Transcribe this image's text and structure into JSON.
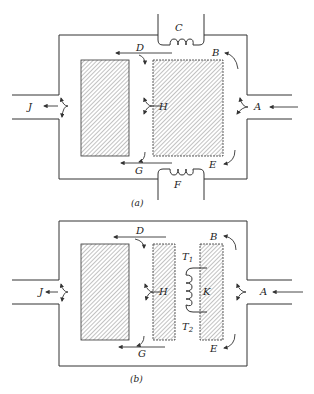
{
  "figure_a": {
    "caption": "(a)",
    "labels": {
      "A": "A",
      "B": "B",
      "C": "C",
      "D": "D",
      "E": "E",
      "F": "F",
      "G": "G",
      "H": "H",
      "J": "J"
    }
  },
  "figure_b": {
    "caption": "(b)",
    "labels": {
      "A": "A",
      "B": "B",
      "D": "D",
      "E": "E",
      "G": "G",
      "H": "H",
      "J": "J",
      "K": "K",
      "T1": "T",
      "T1_sub": "1",
      "T2": "T",
      "T2_sub": "2"
    }
  },
  "colors": {
    "line": "#333333",
    "hatch": "#555555",
    "background": "#ffffff"
  }
}
